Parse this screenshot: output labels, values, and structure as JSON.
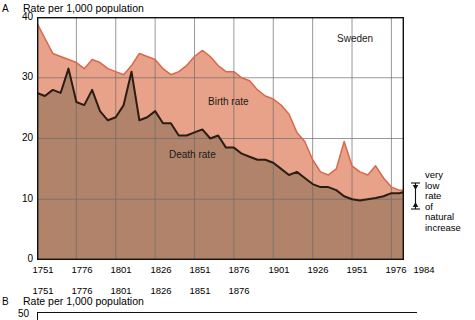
{
  "panel_a": {
    "mark": "A",
    "caption": "Rate per 1,000 population",
    "title": "Sweden",
    "series_labels": {
      "birth": "Birth rate",
      "death": "Death rate"
    },
    "annotation": {
      "line1": "very",
      "line2": "low",
      "line3": "rate",
      "line4": "of",
      "line5": "natural",
      "line6": "increase"
    }
  },
  "panel_b": {
    "mark": "B",
    "caption": "Rate per 1,000 population",
    "y_top_label": "50",
    "xticks": [
      "1751",
      "1776",
      "1801",
      "1826",
      "1851",
      "1876"
    ]
  },
  "colors": {
    "birth_band": "#e8a289",
    "death_area": "#b0836a",
    "birth_line": "#d9684a",
    "death_line": "#2b1d14",
    "grid": "#6b6b6b",
    "axis": "#111111",
    "plot_bg": "#ffffff"
  },
  "chart_data": {
    "type": "area",
    "title": "Sweden",
    "xlabel": "",
    "ylabel": "Rate per 1,000 population",
    "xlim": [
      1751,
      1984
    ],
    "ylim": [
      0,
      40
    ],
    "yticks": [
      0,
      10,
      20,
      30,
      40
    ],
    "ytick_labels": [
      "0",
      "10",
      "20",
      "30",
      "40"
    ],
    "xticks": [
      1751,
      1776,
      1801,
      1826,
      1851,
      1876,
      1901,
      1926,
      1951,
      1976,
      1984
    ],
    "xtick_labels": [
      "1751",
      "1776",
      "1801",
      "1826",
      "1851",
      "1876",
      "1901",
      "1926",
      "1951",
      "1976",
      "1984"
    ],
    "grid": true,
    "legend_position": "in-plot-labels",
    "annotations": [
      {
        "text": "Sweden",
        "x": 1941,
        "y": 37
      },
      {
        "text": "Birth rate",
        "x": 1856,
        "y": 25.5
      },
      {
        "text": "Death rate",
        "x": 1831,
        "y": 16.5
      },
      {
        "text": "very low rate of natural increase",
        "x": 1990,
        "y": 11
      }
    ],
    "series": [
      {
        "name": "Birth rate",
        "x": [
          1751,
          1756,
          1761,
          1766,
          1771,
          1776,
          1781,
          1786,
          1791,
          1796,
          1801,
          1806,
          1811,
          1816,
          1821,
          1826,
          1831,
          1836,
          1841,
          1846,
          1851,
          1856,
          1861,
          1866,
          1871,
          1876,
          1881,
          1886,
          1891,
          1896,
          1901,
          1906,
          1911,
          1916,
          1921,
          1926,
          1931,
          1936,
          1941,
          1946,
          1951,
          1956,
          1961,
          1966,
          1971,
          1976,
          1981,
          1984
        ],
        "y": [
          39.0,
          36.5,
          34.0,
          33.5,
          33.0,
          32.5,
          31.5,
          33.0,
          32.5,
          31.5,
          31.0,
          30.5,
          32.0,
          34.0,
          33.5,
          33.0,
          31.5,
          30.5,
          31.0,
          32.0,
          33.5,
          34.5,
          33.5,
          32.0,
          31.0,
          31.0,
          30.0,
          29.5,
          28.0,
          27.0,
          26.5,
          25.5,
          24.0,
          21.0,
          19.5,
          16.5,
          14.5,
          14.0,
          15.0,
          19.5,
          15.5,
          14.5,
          14.0,
          15.5,
          13.5,
          12.0,
          11.5,
          11.5
        ]
      },
      {
        "name": "Death rate",
        "x": [
          1751,
          1756,
          1761,
          1766,
          1771,
          1776,
          1781,
          1786,
          1791,
          1796,
          1801,
          1806,
          1811,
          1816,
          1821,
          1826,
          1831,
          1836,
          1841,
          1846,
          1851,
          1856,
          1861,
          1866,
          1871,
          1876,
          1881,
          1886,
          1891,
          1896,
          1901,
          1906,
          1911,
          1916,
          1921,
          1926,
          1931,
          1936,
          1941,
          1946,
          1951,
          1956,
          1961,
          1966,
          1971,
          1976,
          1981,
          1984
        ],
        "y": [
          27.5,
          27.0,
          28.0,
          27.5,
          31.5,
          26.0,
          25.5,
          28.0,
          24.5,
          23.0,
          23.5,
          25.5,
          31.0,
          23.0,
          23.5,
          24.5,
          22.5,
          22.5,
          20.5,
          20.5,
          21.0,
          21.5,
          20.0,
          20.5,
          18.5,
          18.5,
          17.5,
          17.0,
          16.5,
          16.5,
          16.0,
          15.0,
          14.0,
          14.5,
          13.5,
          12.5,
          12.0,
          12.0,
          11.5,
          10.5,
          10.0,
          9.8,
          10.0,
          10.2,
          10.5,
          11.0,
          11.0,
          11.2
        ]
      }
    ]
  }
}
